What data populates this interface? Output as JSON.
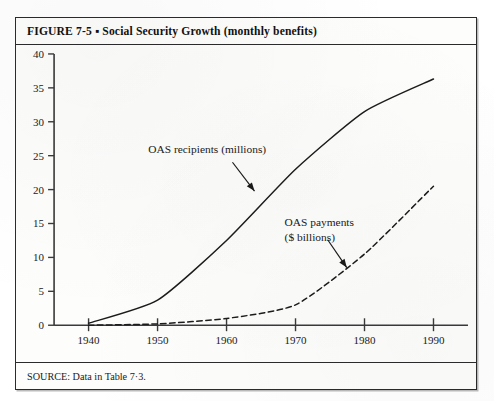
{
  "figure": {
    "caption": "FIGURE 7-5 ▪ Social Security Growth (monthly benefits)",
    "source": "SOURCE: Data in Table 7·3."
  },
  "chart_data": {
    "type": "line",
    "title": "Social Security Growth (monthly benefits)",
    "xlabel": "",
    "ylabel": "",
    "xlim": [
      1935,
      1995
    ],
    "ylim": [
      0,
      40
    ],
    "xticks": [
      "1940",
      "1950",
      "1960",
      "1970",
      "1980",
      "1990"
    ],
    "yticks": [
      "0",
      "5",
      "10",
      "15",
      "20",
      "25",
      "30",
      "35",
      "40"
    ],
    "grid": false,
    "legend_position": "inline-annotations",
    "x": [
      1940,
      1950,
      1960,
      1970,
      1980,
      1990
    ],
    "series": [
      {
        "name": "OAS recipients (millions)",
        "style": "solid",
        "values": [
          0.3,
          3.7,
          12.5,
          23.0,
          31.5,
          36.3
        ]
      },
      {
        "name": "OAS payments ($ billions)",
        "style": "dashed",
        "values": [
          0.0,
          0.2,
          1.0,
          3.0,
          10.5,
          20.5
        ]
      }
    ],
    "annotations": [
      {
        "text_line1": "OAS recipients (millions)",
        "text_line2": "",
        "points_to_year": 1967,
        "points_to_value": 20.5
      },
      {
        "text_line1": "OAS payments",
        "text_line2": "($ billions)",
        "points_to_year": 1978.5,
        "points_to_value": 9.5
      }
    ],
    "colors": {
      "axis": "#3a3a3a",
      "recipients_line": "#1c1c1c",
      "payments_line": "#1c1c1c"
    }
  }
}
